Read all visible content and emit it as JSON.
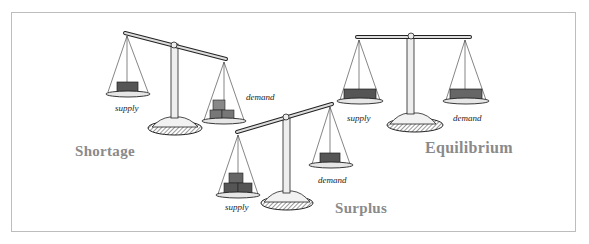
{
  "diagram": {
    "scales": [
      {
        "id": "shortage",
        "title": "Shortage",
        "left_label": "supply",
        "right_label": "demand",
        "tilt": "left-pan-up"
      },
      {
        "id": "surplus",
        "title": "Surplus",
        "left_label": "supply",
        "right_label": "demand",
        "tilt": "right-pan-up"
      },
      {
        "id": "equilibrium",
        "title": "Equilibrium",
        "left_label": "supply",
        "right_label": "demand",
        "tilt": "balanced"
      }
    ],
    "colors": {
      "title": "#8a8a8a",
      "frame": "#bdbdbd",
      "ink": "#222222",
      "box": "#555555"
    }
  }
}
